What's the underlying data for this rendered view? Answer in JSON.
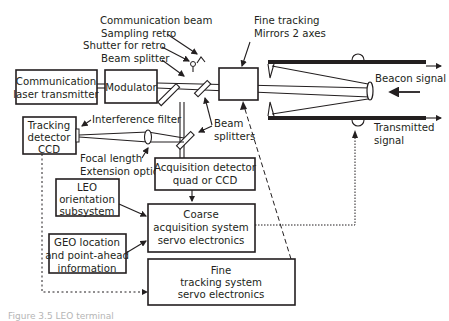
{
  "figure": {
    "caption": "Figure 3.5  LEO terminal"
  },
  "labels": {
    "communication_beam": "Communication beam",
    "sampling_retro": "Sampling retro",
    "shutter_for_retro": "Shutter for retro",
    "beam_splitter": "Beam splitter",
    "fine_tracking_line1": "Fine tracking",
    "fine_tracking_line2": "Mirrors 2 axes",
    "beacon_signal": "Beacon signal",
    "transmitted_line1": "Transmitted",
    "transmitted_line2": "signal",
    "interference_filter": "Interference filter",
    "beam_splitters_line1": "Beam",
    "beam_splitters_line2": "splitters",
    "focal_length_line1": "Focal length",
    "focal_length_line2": "Extension optics"
  },
  "boxes": {
    "comm_laser": [
      "Communication",
      "laser transmitter"
    ],
    "modulator": [
      "Modulator"
    ],
    "tracking_detector": [
      "Tracking",
      "detector",
      "CCD"
    ],
    "acquisition_detector": [
      "Acquisition detector",
      "quad or CCD"
    ],
    "leo_orientation": [
      "LEO",
      "orientation",
      "subsystem"
    ],
    "geo_location": [
      "GEO location",
      "and point-ahead",
      "information"
    ],
    "coarse_acquisition": [
      "Coarse",
      "acquisition system",
      "servo electronics"
    ],
    "fine_tracking_servo": [
      "Fine",
      "tracking system",
      "servo electronics"
    ]
  }
}
